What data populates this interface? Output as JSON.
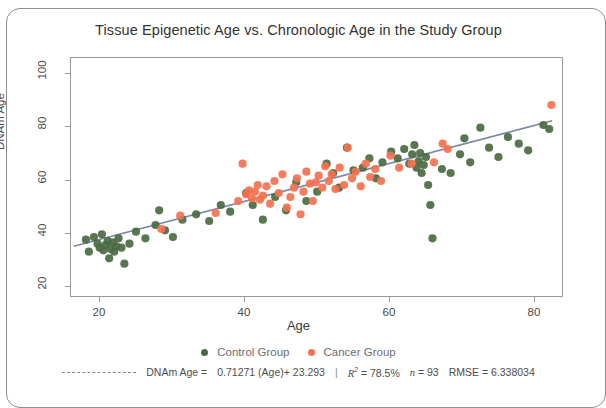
{
  "chart_data": {
    "type": "scatter",
    "title": "Tissue Epigenetic Age vs. Chronologic Age in the Study Group",
    "xlabel": "Age",
    "ylabel": "DNAm Age",
    "xlim": [
      16,
      84
    ],
    "ylim": [
      16,
      106
    ],
    "xticks": [
      20,
      40,
      60,
      80
    ],
    "yticks": [
      20,
      40,
      60,
      80,
      100
    ],
    "grid": false,
    "legend_position": "bottom",
    "series": [
      {
        "name": "Control Group",
        "color": "#4a6b42",
        "points": [
          [
            18.2,
            37.5
          ],
          [
            18.6,
            33.0
          ],
          [
            19.3,
            38.5
          ],
          [
            19.8,
            36.0
          ],
          [
            20.1,
            34.5
          ],
          [
            20.4,
            39.5
          ],
          [
            20.6,
            33.5
          ],
          [
            20.9,
            35.5
          ],
          [
            21.2,
            37.0
          ],
          [
            21.4,
            30.5
          ],
          [
            21.6,
            34.0
          ],
          [
            21.9,
            36.5
          ],
          [
            22.1,
            33.0
          ],
          [
            22.4,
            35.0
          ],
          [
            22.7,
            38.0
          ],
          [
            23.1,
            34.5
          ],
          [
            23.5,
            28.5
          ],
          [
            24.2,
            36.0
          ],
          [
            25.1,
            40.5
          ],
          [
            26.4,
            38.0
          ],
          [
            27.8,
            43.0
          ],
          [
            28.3,
            48.5
          ],
          [
            29.1,
            41.0
          ],
          [
            30.2,
            38.5
          ],
          [
            31.5,
            45.0
          ],
          [
            33.4,
            47.0
          ],
          [
            35.2,
            44.5
          ],
          [
            36.8,
            50.5
          ],
          [
            38.1,
            48.0
          ],
          [
            40.3,
            55.0
          ],
          [
            41.2,
            50.5
          ],
          [
            42.6,
            45.0
          ],
          [
            44.3,
            53.5
          ],
          [
            45.8,
            48.5
          ],
          [
            47.2,
            59.0
          ],
          [
            48.6,
            52.0
          ],
          [
            50.1,
            55.5
          ],
          [
            51.4,
            66.0
          ],
          [
            52.3,
            62.5
          ],
          [
            53.1,
            57.0
          ],
          [
            54.2,
            72.0
          ],
          [
            55.1,
            63.5
          ],
          [
            56.4,
            64.5
          ],
          [
            57.3,
            68.0
          ],
          [
            58.2,
            60.5
          ],
          [
            59.1,
            66.5
          ],
          [
            60.3,
            70.5
          ],
          [
            61.2,
            68.0
          ],
          [
            62.1,
            71.5
          ],
          [
            62.8,
            66.0
          ],
          [
            63.2,
            69.5
          ],
          [
            63.5,
            73.0
          ],
          [
            63.8,
            64.5
          ],
          [
            64.1,
            67.0
          ],
          [
            64.3,
            70.0
          ],
          [
            64.5,
            62.5
          ],
          [
            64.8,
            65.5
          ],
          [
            65.1,
            68.5
          ],
          [
            65.4,
            58.0
          ],
          [
            65.7,
            50.5
          ],
          [
            66.0,
            38.0
          ],
          [
            67.3,
            64.0
          ],
          [
            68.5,
            62.5
          ],
          [
            69.8,
            69.5
          ],
          [
            70.4,
            75.5
          ],
          [
            71.2,
            66.5
          ],
          [
            72.6,
            79.5
          ],
          [
            73.8,
            72.0
          ],
          [
            75.1,
            68.5
          ],
          [
            76.4,
            76.0
          ],
          [
            77.9,
            73.5
          ],
          [
            79.2,
            71.0
          ],
          [
            81.3,
            80.5
          ],
          [
            82.1,
            79.0
          ]
        ]
      },
      {
        "name": "Cancer Group",
        "color": "#f4714f",
        "points": [
          [
            28.6,
            41.5
          ],
          [
            31.2,
            46.5
          ],
          [
            36.1,
            47.5
          ],
          [
            39.2,
            52.0
          ],
          [
            39.8,
            66.0
          ],
          [
            40.3,
            54.5
          ],
          [
            40.7,
            56.0
          ],
          [
            41.1,
            53.0
          ],
          [
            41.5,
            55.5
          ],
          [
            41.9,
            58.0
          ],
          [
            42.2,
            52.5
          ],
          [
            42.6,
            54.0
          ],
          [
            43.1,
            57.5
          ],
          [
            43.6,
            51.0
          ],
          [
            44.2,
            59.5
          ],
          [
            44.8,
            55.0
          ],
          [
            45.3,
            62.0
          ],
          [
            45.9,
            49.5
          ],
          [
            46.4,
            53.5
          ],
          [
            46.9,
            57.0
          ],
          [
            47.3,
            60.5
          ],
          [
            47.8,
            47.0
          ],
          [
            48.2,
            55.5
          ],
          [
            48.6,
            63.0
          ],
          [
            49.1,
            58.5
          ],
          [
            49.5,
            52.0
          ],
          [
            49.9,
            59.0
          ],
          [
            50.3,
            61.5
          ],
          [
            50.8,
            57.0
          ],
          [
            51.2,
            65.0
          ],
          [
            51.7,
            59.5
          ],
          [
            52.1,
            62.0
          ],
          [
            52.6,
            56.5
          ],
          [
            53.2,
            64.5
          ],
          [
            53.8,
            58.0
          ],
          [
            54.3,
            72.0
          ],
          [
            54.9,
            60.5
          ],
          [
            55.4,
            63.0
          ],
          [
            56.1,
            57.5
          ],
          [
            56.8,
            66.0
          ],
          [
            57.4,
            61.0
          ],
          [
            58.1,
            64.0
          ],
          [
            58.9,
            59.5
          ],
          [
            60.2,
            69.0
          ],
          [
            61.4,
            64.5
          ],
          [
            63.1,
            66.0
          ],
          [
            66.2,
            66.5
          ],
          [
            67.4,
            73.5
          ],
          [
            68.1,
            71.5
          ],
          [
            82.4,
            88.0
          ]
        ]
      }
    ],
    "fit_line": {
      "slope": 0.71271,
      "intercept": 23.293,
      "color": "#7a86ab",
      "x_start": 16.5,
      "x_end": 82.5
    },
    "annotations": {
      "equation_prefix": "DNAm Age =",
      "equation_body": "0.71271 (Age)+ 23.293",
      "separator": "|",
      "r2_symbol": "R",
      "r2_exponent": "2",
      "r2_value": "= 78.5%",
      "n_symbol": "n",
      "n_value": "= 93",
      "rmse_label": "RMSE =",
      "rmse_value": "6.338034"
    }
  }
}
